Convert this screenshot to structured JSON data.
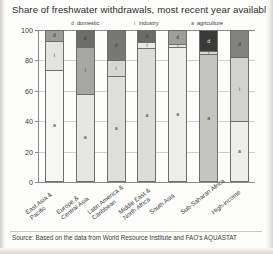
{
  "title": "Share of freshwater withdrawals, most recent year available (%)",
  "source": "Source: Based on the data from World Resource Institute and FAO's  AQUASTAT",
  "legend": {
    "domestic": {
      "key": "d",
      "label": "domestic"
    },
    "industry": {
      "key": "i",
      "label": "industry"
    },
    "agriculture": {
      "key": "a",
      "label": "agriculture"
    }
  },
  "yticks": [
    "100",
    "80",
    "60",
    "40",
    "20",
    "0"
  ],
  "segment_keys": {
    "agriculture": "a",
    "industry": "i",
    "domestic": "d"
  },
  "categories_wrapped": [
    [
      "East Asia &",
      "Pacific"
    ],
    [
      "Europe &",
      "Central Asia"
    ],
    [
      "Latin America &",
      "Caribbean"
    ],
    [
      "Middle East &",
      "North Africa"
    ],
    [
      "South Asia"
    ],
    [
      "Sub-Saharan Africa"
    ],
    [
      "High-income"
    ]
  ],
  "chart_data": {
    "type": "bar",
    "title": "Share of freshwater withdrawals, most recent year available (%)",
    "xlabel": "",
    "ylabel": "",
    "ylim": [
      0,
      100
    ],
    "yticks": [
      0,
      20,
      40,
      60,
      80,
      100
    ],
    "grid": true,
    "stacked": true,
    "legend_position": "top",
    "categories": [
      "East Asia & Pacific",
      "Europe & Central Asia",
      "Latin America & Caribbean",
      "Middle East & North Africa",
      "South Asia",
      "Sub-Saharan Africa",
      "High-income"
    ],
    "series": [
      {
        "name": "agriculture",
        "key": "a",
        "color": "#ececea",
        "values": [
          74,
          58,
          70,
          88,
          89,
          84,
          40
        ]
      },
      {
        "name": "industry",
        "key": "i",
        "color": "#d0cfcb",
        "values": [
          19,
          31,
          10,
          4,
          2,
          2,
          42
        ]
      },
      {
        "name": "domestic",
        "key": "d",
        "color": "#8f8f8d",
        "values": [
          7,
          11,
          20,
          8,
          9,
          14,
          18
        ]
      }
    ]
  }
}
